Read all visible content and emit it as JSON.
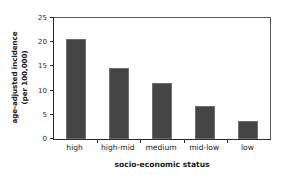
{
  "chart_data": {
    "type": "bar",
    "title": "",
    "categories": [
      "high",
      "high-mid",
      "medium",
      "mid-low",
      "low"
    ],
    "values": [
      20.6,
      14.6,
      11.6,
      6.9,
      3.7
    ],
    "xlabel": "socio-economic status",
    "ylabel": "age-adjusted incidence (per 100,000)",
    "ylabel_lines": [
      "age-adjusted incidence",
      "(per 100,000)"
    ],
    "ylim": [
      0,
      25
    ],
    "yticks": [
      0,
      5,
      10,
      15,
      20,
      25
    ],
    "ytick_labels": [
      "0",
      "5",
      "10",
      "15",
      "20",
      "25"
    ],
    "grid": false,
    "legend": false,
    "bar_color": "#454545",
    "bar_edge_color": "#6e6e6e",
    "axis_color": "#2b2b2b",
    "background": "#ffffff"
  }
}
